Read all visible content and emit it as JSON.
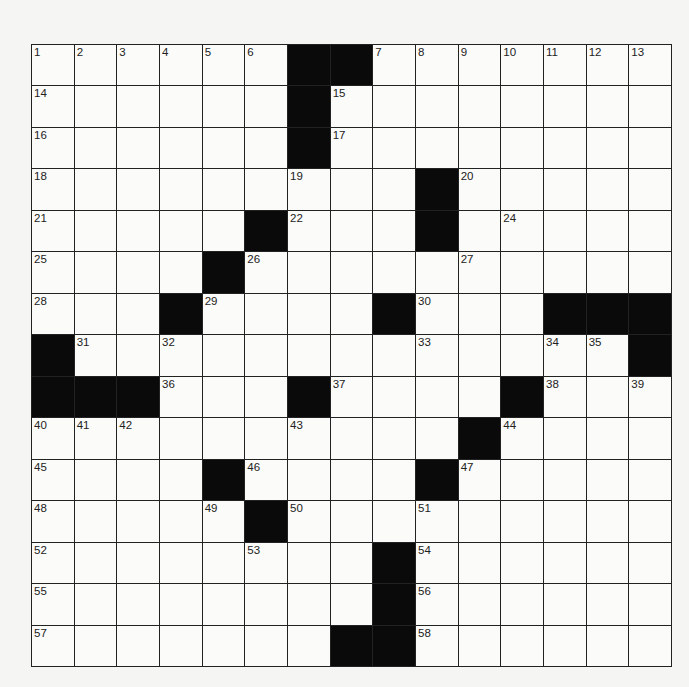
{
  "puzzle": {
    "rows": 15,
    "cols": 15,
    "colors": {
      "black": "#0a0a0a",
      "white": "#fbfbf9",
      "line": "#222222"
    },
    "layout": [
      "......##.......",
      "......#........",
      "......#........",
      ".........#.....",
      ".....#...#.....",
      "....#..........",
      "...#....#...###",
      "#.............#",
      "###...#....#...",
      "..........#....",
      "....#....#.....",
      ".....#.........",
      "........#......",
      "........#......",
      ".......##......"
    ],
    "numbers": [
      [
        1,
        2,
        3,
        4,
        5,
        6,
        null,
        null,
        7,
        8,
        9,
        10,
        11,
        12,
        13
      ],
      [
        14,
        null,
        null,
        null,
        null,
        null,
        null,
        15,
        null,
        null,
        null,
        null,
        null,
        null,
        null
      ],
      [
        16,
        null,
        null,
        null,
        null,
        null,
        null,
        17,
        null,
        null,
        null,
        null,
        null,
        null,
        null
      ],
      [
        18,
        null,
        null,
        null,
        null,
        null,
        19,
        null,
        null,
        null,
        20,
        null,
        null,
        null,
        null
      ],
      [
        21,
        null,
        null,
        null,
        null,
        null,
        22,
        null,
        null,
        23,
        null,
        24,
        null,
        null,
        null
      ],
      [
        25,
        null,
        null,
        null,
        null,
        26,
        null,
        null,
        null,
        null,
        27,
        null,
        null,
        null,
        null
      ],
      [
        28,
        null,
        null,
        null,
        29,
        null,
        null,
        null,
        null,
        30,
        null,
        null,
        null,
        null,
        null
      ],
      [
        null,
        31,
        null,
        32,
        null,
        null,
        null,
        null,
        null,
        33,
        null,
        null,
        34,
        35,
        null
      ],
      [
        null,
        null,
        null,
        36,
        null,
        null,
        null,
        37,
        null,
        null,
        null,
        null,
        38,
        null,
        39
      ],
      [
        40,
        41,
        42,
        null,
        null,
        null,
        43,
        null,
        null,
        null,
        null,
        44,
        null,
        null,
        null
      ],
      [
        45,
        null,
        null,
        null,
        null,
        46,
        null,
        null,
        null,
        null,
        47,
        null,
        null,
        null,
        null
      ],
      [
        48,
        null,
        null,
        null,
        49,
        null,
        50,
        null,
        null,
        51,
        null,
        null,
        null,
        null,
        null
      ],
      [
        52,
        null,
        null,
        null,
        null,
        53,
        null,
        null,
        null,
        54,
        null,
        null,
        null,
        null,
        null
      ],
      [
        55,
        null,
        null,
        null,
        null,
        null,
        null,
        null,
        null,
        56,
        null,
        null,
        null,
        null,
        null
      ],
      [
        57,
        null,
        null,
        null,
        null,
        null,
        null,
        null,
        null,
        58,
        null,
        null,
        null,
        null,
        null
      ]
    ],
    "entries": []
  }
}
